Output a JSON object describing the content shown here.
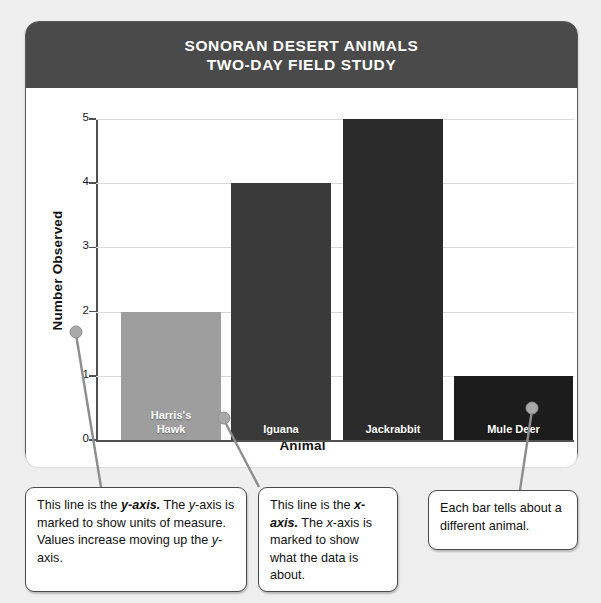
{
  "card": {
    "title_line1": "SONORAN DESERT ANIMALS",
    "title_line2": "TWO-DAY FIELD STUDY"
  },
  "chart_data": {
    "type": "bar",
    "title": "SONORAN DESERT ANIMALS TWO-DAY FIELD STUDY",
    "categories": [
      "Harris's Hawk",
      "Iguana",
      "Jackrabbit",
      "Mule Deer"
    ],
    "values": [
      2,
      4,
      5,
      1
    ],
    "bar_colors": [
      "#9e9e9e",
      "#3a3a3a",
      "#2b2b2b",
      "#1c1c1c"
    ],
    "xlabel": "Animal",
    "ylabel": "Number Observed",
    "ylim": [
      0,
      5
    ],
    "yticks": [
      0,
      1,
      2,
      3,
      4,
      5
    ],
    "ytick_labels": [
      "0",
      "1",
      "2",
      "3",
      "4",
      "5"
    ],
    "grid": true,
    "legend": "none",
    "bar_label_position": "inside-bottom",
    "bar_labels": [
      [
        "Harris's",
        "Hawk"
      ],
      [
        "Iguana"
      ],
      [
        "Jackrabbit"
      ],
      [
        "Mule Deer"
      ]
    ]
  },
  "callouts": [
    {
      "id": "y-axis-callout",
      "segments": [
        {
          "text": "This line is the ",
          "style": "normal"
        },
        {
          "text": "y-axis.",
          "style": "bold-italic"
        },
        {
          "text": " The ",
          "style": "normal"
        },
        {
          "text": "y",
          "style": "italic"
        },
        {
          "text": "-axis is marked to show units of measure. Values increase moving up the ",
          "style": "normal"
        },
        {
          "text": "y",
          "style": "italic"
        },
        {
          "text": "-axis.",
          "style": "normal"
        }
      ],
      "plain": "This line is the y-axis. The y-axis is marked to show units of measure. Values increase moving up the y-axis."
    },
    {
      "id": "x-axis-callout",
      "segments": [
        {
          "text": "This line is the ",
          "style": "normal"
        },
        {
          "text": "x-axis.",
          "style": "bold-italic"
        },
        {
          "text": " The ",
          "style": "normal"
        },
        {
          "text": "x",
          "style": "italic"
        },
        {
          "text": "-axis is marked to show what the data is about.",
          "style": "normal"
        }
      ],
      "plain": "This line is the x-axis. The x-axis is marked to show what the data is about."
    },
    {
      "id": "bars-callout",
      "segments": [
        {
          "text": "Each bar tells about a different animal.",
          "style": "normal"
        }
      ],
      "plain": "Each bar tells about a different animal."
    }
  ],
  "colors": {
    "header_band": "#4a4a4a",
    "page_background": "#efefef",
    "axis": "#4f4f4f",
    "grid": "#d9d9d9",
    "leader_line": "#8d8d8d"
  }
}
